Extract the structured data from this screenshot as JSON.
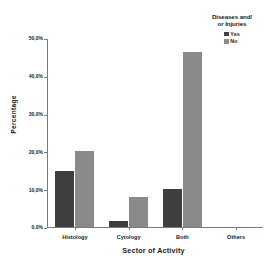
{
  "chart_data": {
    "type": "bar",
    "title": "",
    "xlabel": "Sector of Activity",
    "ylabel": "Percentage",
    "categories": [
      "Histology",
      "Cytology",
      "Both",
      "Others"
    ],
    "series": [
      {
        "name": "Yes",
        "values": [
          14.8,
          1.7,
          10.0,
          0.0
        ],
        "color": "#3f3f3f"
      },
      {
        "name": "No",
        "values": [
          20.0,
          8.0,
          46.2,
          0.0
        ],
        "color": "#8a8a8a"
      }
    ],
    "ylim": [
      0.0,
      50.0
    ],
    "ytick_values": [
      50.0,
      40.0,
      30.0,
      20.0,
      10.0,
      0.0
    ],
    "ytick_labels": [
      "50,0%",
      "40,0%",
      "30,0%",
      "20,0%",
      "10,0%",
      "0,0%"
    ],
    "grid": false,
    "legend_position": "top-right",
    "legend_title": "Diseases and/ or Injuries"
  },
  "legend": {
    "title_line1": "Diseases and/",
    "title_line2": "or Injuries",
    "entries": [
      {
        "label": "Yes",
        "color": "#3f3f3f"
      },
      {
        "label": "No",
        "color": "#8a8a8a"
      }
    ]
  },
  "axes": {
    "y_title": "Percentage",
    "x_title": "Sector of Activity"
  },
  "colors": {
    "background": "#ffffff",
    "axis": "#7a7a7a",
    "text": "#1c1c1c",
    "series_yes": "#3f3f3f",
    "series_no": "#8a8a8a"
  }
}
